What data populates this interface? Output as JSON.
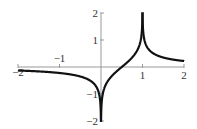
{
  "chart_data": {
    "type": "line",
    "title": "",
    "xlabel": "",
    "ylabel": "",
    "xlim": [
      -2,
      2
    ],
    "ylim": [
      -2,
      2
    ],
    "grid": false,
    "legend": null,
    "x_ticks": [
      -2,
      -1,
      1,
      2
    ],
    "y_ticks": [
      2,
      1,
      -1,
      -2
    ],
    "x_tick_labels": [
      "−2",
      "−1",
      "1",
      "2"
    ],
    "y_tick_labels": [
      "2",
      "1",
      "−1",
      "−2"
    ],
    "vertical_asymptotes_spikes": [
      0,
      1
    ],
    "series": [
      {
        "name": "f(x)",
        "color": "#111111",
        "description": "approx 0.32*ln|x/(x-1)|, clipped to [-2,2]; cusp down to -2 at x=0, cusp up to 2 at x=1, zero at x=0.5",
        "x": [
          -2,
          -1.5,
          -1,
          -0.5,
          -0.25,
          -0.1,
          -0.02,
          0,
          0.02,
          0.1,
          0.25,
          0.5,
          0.75,
          0.9,
          0.98,
          1,
          1.02,
          1.1,
          1.25,
          1.5,
          2
        ],
        "y": [
          -0.13,
          -0.16,
          -0.22,
          -0.35,
          -0.52,
          -0.77,
          -1.25,
          -2,
          -1.25,
          -0.7,
          -0.35,
          0,
          0.35,
          0.7,
          1.25,
          2,
          1.25,
          0.77,
          0.52,
          0.35,
          0.22
        ]
      }
    ]
  }
}
